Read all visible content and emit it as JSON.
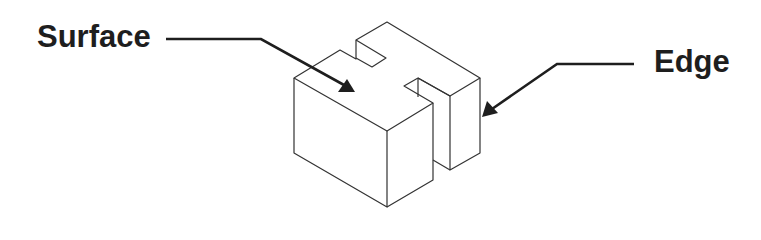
{
  "diagram": {
    "type": "isometric-block-callout",
    "labels": {
      "surface": "Surface",
      "edge": "Edge"
    },
    "colors": {
      "background": "#ffffff",
      "outline": "#333333",
      "leader": "#1e1e1e",
      "text": "#1e1e1e"
    },
    "callouts": [
      {
        "label": "Surface",
        "points_to": "top face of block"
      },
      {
        "label": "Edge",
        "points_to": "right vertical edge of block"
      }
    ]
  }
}
